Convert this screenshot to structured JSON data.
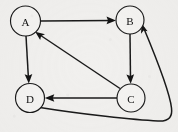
{
  "diagram": {
    "type": "directed-graph",
    "canvas": {
      "width": 178,
      "height": 132
    },
    "background_color": "#f1f0ee",
    "stroke_color": "#1a1a1a",
    "node_fill_color": "#f4f3f1",
    "nodes": [
      {
        "id": "A",
        "label": "A",
        "cx": 25.5,
        "cy": 21.0,
        "r": 15.0
      },
      {
        "id": "B",
        "label": "B",
        "cx": 130.0,
        "cy": 20.0,
        "r": 14.0
      },
      {
        "id": "C",
        "label": "C",
        "cx": 131.0,
        "cy": 98.0,
        "r": 14.0
      },
      {
        "id": "D",
        "label": "D",
        "cx": 30.0,
        "cy": 98.0,
        "r": 14.5
      }
    ],
    "edges": [
      {
        "from": "A",
        "to": "B",
        "shape": "straight",
        "direction": "right"
      },
      {
        "from": "A",
        "to": "D",
        "shape": "straight",
        "direction": "down"
      },
      {
        "from": "B",
        "to": "C",
        "shape": "straight",
        "direction": "down"
      },
      {
        "from": "C",
        "to": "D",
        "shape": "straight",
        "direction": "left"
      },
      {
        "from": "C",
        "to": "A",
        "shape": "straight",
        "direction": "diagonal-up-left"
      },
      {
        "from": "D",
        "to": "B",
        "shape": "curved",
        "direction": "around-right"
      }
    ]
  }
}
